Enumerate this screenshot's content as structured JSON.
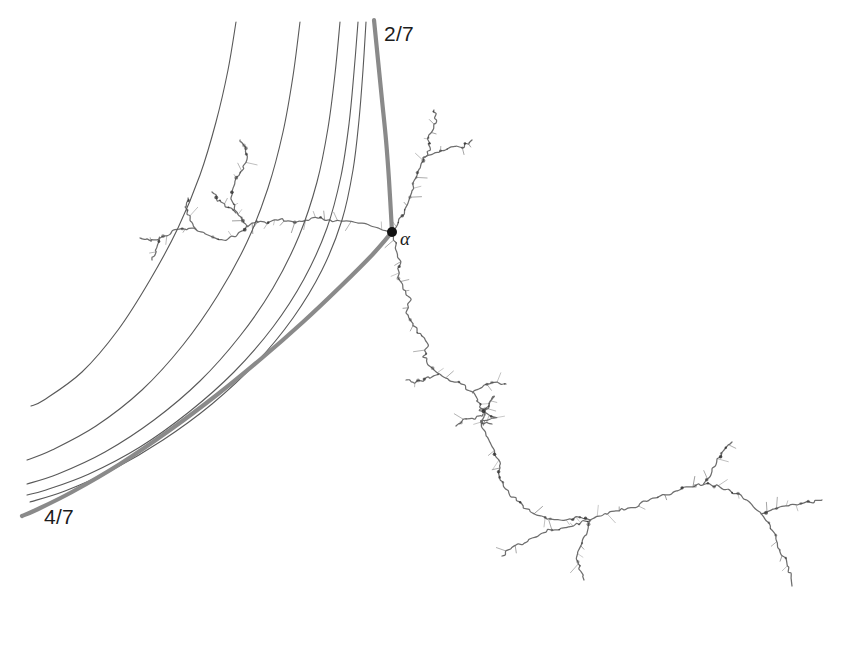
{
  "figure": {
    "background_color": "#ffffff",
    "width": 843,
    "height": 662
  },
  "labels": {
    "ray_upper": "2/7",
    "ray_lower": "4/7",
    "fixed_point": "α"
  },
  "colors": {
    "background": "#ffffff",
    "thin_ray": "#595959",
    "thick_ray": "#8a8a8a",
    "julia_set": "#6e6e6e",
    "julia_set_dark": "#2b2b2b",
    "landing_point": "#111111",
    "label_text": "#1c1c1c"
  },
  "chart_data": {
    "type": "scatter",
    "subtitle": "",
    "xlabel": "",
    "ylabel": "",
    "grid": false,
    "legend": "none",
    "annotations": [
      {
        "text": "2/7",
        "x": 384,
        "y": 32,
        "role": "external-ray-angle-label"
      },
      {
        "text": "4/7",
        "x": 44,
        "y": 515,
        "role": "external-ray-angle-label"
      },
      {
        "text": "α",
        "x": 400,
        "y": 238,
        "role": "fixed-point-label"
      }
    ],
    "landing_point": {
      "x": 392,
      "y": 232,
      "label": "α",
      "radius": 5
    },
    "rays": [
      {
        "name": "ray-thin-1",
        "stroke": "#595959",
        "width": 1.1,
        "points": [
          [
            236,
            22
          ],
          [
            228,
            70
          ],
          [
            216,
            122
          ],
          [
            200,
            175
          ],
          [
            178,
            228
          ],
          [
            150,
            280
          ],
          [
            118,
            330
          ],
          [
            82,
            372
          ],
          [
            44,
            400
          ],
          [
            31,
            406
          ]
        ]
      },
      {
        "name": "ray-thin-2",
        "stroke": "#595959",
        "width": 1.1,
        "points": [
          [
            300,
            22
          ],
          [
            293,
            76
          ],
          [
            283,
            132
          ],
          [
            268,
            188
          ],
          [
            247,
            242
          ],
          [
            218,
            295
          ],
          [
            183,
            345
          ],
          [
            142,
            390
          ],
          [
            96,
            426
          ],
          [
            52,
            450
          ],
          [
            27,
            460
          ]
        ]
      },
      {
        "name": "ray-thin-3",
        "stroke": "#595959",
        "width": 1.1,
        "points": [
          [
            340,
            22
          ],
          [
            335,
            74
          ],
          [
            328,
            128
          ],
          [
            317,
            182
          ],
          [
            299,
            236
          ],
          [
            273,
            288
          ],
          [
            240,
            336
          ],
          [
            200,
            381
          ],
          [
            154,
            420
          ],
          [
            105,
            452
          ],
          [
            58,
            474
          ],
          [
            27,
            484
          ]
        ]
      },
      {
        "name": "ray-thin-4",
        "stroke": "#595959",
        "width": 1.1,
        "points": [
          [
            358,
            22
          ],
          [
            354,
            72
          ],
          [
            349,
            124
          ],
          [
            341,
            176
          ],
          [
            327,
            228
          ],
          [
            304,
            279
          ],
          [
            273,
            327
          ],
          [
            234,
            372
          ],
          [
            189,
            412
          ],
          [
            140,
            447
          ],
          [
            89,
            474
          ],
          [
            46,
            490
          ],
          [
            27,
            495
          ]
        ]
      },
      {
        "name": "ray-thin-5",
        "stroke": "#595959",
        "width": 1.1,
        "points": [
          [
            366,
            22
          ],
          [
            363,
            70
          ],
          [
            359,
            120
          ],
          [
            353,
            170
          ],
          [
            342,
            220
          ],
          [
            322,
            270
          ],
          [
            293,
            318
          ],
          [
            256,
            363
          ],
          [
            212,
            404
          ],
          [
            163,
            440
          ],
          [
            112,
            470
          ],
          [
            65,
            491
          ],
          [
            30,
            502
          ]
        ]
      },
      {
        "name": "ray-thick-2-7",
        "stroke": "#8a8a8a",
        "width": 4.2,
        "label": "2/7",
        "points": [
          [
            374,
            20
          ],
          [
            378,
            60
          ],
          [
            382,
            100
          ],
          [
            386,
            140
          ],
          [
            389,
            180
          ],
          [
            392,
            232
          ]
        ]
      },
      {
        "name": "ray-thick-4-7",
        "stroke": "#8a8a8a",
        "width": 4.2,
        "label": "4/7",
        "points": [
          [
            392,
            232
          ],
          [
            373,
            254
          ],
          [
            340,
            287
          ],
          [
            303,
            322
          ],
          [
            262,
            358
          ],
          [
            218,
            394
          ],
          [
            170,
            430
          ],
          [
            120,
            464
          ],
          [
            72,
            492
          ],
          [
            36,
            510
          ],
          [
            22,
            516
          ]
        ]
      }
    ],
    "julia_set_branches": [
      {
        "name": "main-dendrite-upper-left",
        "points": [
          [
            392,
            232
          ],
          [
            372,
            226
          ],
          [
            352,
            222
          ],
          [
            332,
            221
          ],
          [
            318,
            217
          ],
          [
            306,
            221
          ],
          [
            292,
            222
          ],
          [
            278,
            219
          ],
          [
            266,
            224
          ],
          [
            256,
            220
          ],
          [
            248,
            226
          ],
          [
            242,
            220
          ],
          [
            236,
            212
          ],
          [
            232,
            200
          ],
          [
            233,
            188
          ],
          [
            238,
            176
          ],
          [
            244,
            166
          ],
          [
            248,
            156
          ],
          [
            245,
            147
          ],
          [
            240,
            140
          ]
        ]
      },
      {
        "name": "dendrite-upper-left-branch-a",
        "points": [
          [
            248,
            226
          ],
          [
            236,
            236
          ],
          [
            222,
            240
          ],
          [
            208,
            236
          ],
          [
            196,
            230
          ],
          [
            184,
            228
          ],
          [
            172,
            232
          ],
          [
            160,
            238
          ],
          [
            150,
            240
          ],
          [
            140,
            238
          ]
        ]
      },
      {
        "name": "dendrite-upper-left-branch-b",
        "points": [
          [
            196,
            230
          ],
          [
            190,
            220
          ],
          [
            186,
            208
          ],
          [
            188,
            198
          ]
        ]
      },
      {
        "name": "dendrite-upper-left-branch-c",
        "points": [
          [
            160,
            238
          ],
          [
            156,
            250
          ],
          [
            152,
            260
          ]
        ]
      },
      {
        "name": "dendrite-upper-left-tip",
        "points": [
          [
            236,
            212
          ],
          [
            226,
            206
          ],
          [
            218,
            200
          ],
          [
            212,
            192
          ]
        ]
      },
      {
        "name": "main-dendrite-upper-right",
        "points": [
          [
            392,
            232
          ],
          [
            400,
            220
          ],
          [
            406,
            206
          ],
          [
            412,
            194
          ],
          [
            414,
            180
          ],
          [
            420,
            170
          ],
          [
            424,
            158
          ],
          [
            430,
            150
          ],
          [
            428,
            140
          ],
          [
            432,
            130
          ],
          [
            436,
            120
          ],
          [
            434,
            110
          ]
        ]
      },
      {
        "name": "dendrite-upper-right-branch",
        "points": [
          [
            424,
            158
          ],
          [
            438,
            152
          ],
          [
            452,
            148
          ],
          [
            464,
            146
          ],
          [
            472,
            140
          ]
        ]
      },
      {
        "name": "main-dendrite-lower",
        "points": [
          [
            392,
            232
          ],
          [
            396,
            248
          ],
          [
            400,
            262
          ],
          [
            398,
            276
          ],
          [
            404,
            288
          ],
          [
            410,
            300
          ],
          [
            406,
            312
          ],
          [
            412,
            324
          ],
          [
            420,
            334
          ],
          [
            428,
            344
          ],
          [
            424,
            356
          ],
          [
            430,
            366
          ],
          [
            440,
            374
          ],
          [
            450,
            380
          ],
          [
            462,
            384
          ],
          [
            472,
            392
          ],
          [
            478,
            402
          ],
          [
            484,
            414
          ],
          [
            482,
            426
          ],
          [
            488,
            438
          ],
          [
            494,
            450
          ],
          [
            500,
            462
          ],
          [
            498,
            474
          ],
          [
            504,
            486
          ],
          [
            512,
            496
          ],
          [
            522,
            506
          ],
          [
            534,
            514
          ],
          [
            548,
            518
          ],
          [
            562,
            520
          ],
          [
            576,
            518
          ],
          [
            590,
            520
          ]
        ]
      },
      {
        "name": "dendrite-lower-branch-left",
        "points": [
          [
            440,
            374
          ],
          [
            428,
            378
          ],
          [
            416,
            382
          ],
          [
            406,
            380
          ]
        ]
      },
      {
        "name": "dendrite-lower-branch-mid",
        "points": [
          [
            484,
            414
          ],
          [
            474,
            418
          ],
          [
            464,
            420
          ],
          [
            456,
            426
          ]
        ]
      },
      {
        "name": "dendrite-lower-branch-right-up",
        "points": [
          [
            472,
            392
          ],
          [
            484,
            386
          ],
          [
            496,
            382
          ],
          [
            506,
            384
          ]
        ]
      },
      {
        "name": "dendrite-trifurcation-down",
        "points": [
          [
            590,
            520
          ],
          [
            586,
            534
          ],
          [
            580,
            546
          ],
          [
            576,
            558
          ],
          [
            580,
            570
          ],
          [
            584,
            580
          ]
        ]
      },
      {
        "name": "dendrite-trifurcation-left",
        "points": [
          [
            590,
            520
          ],
          [
            576,
            524
          ],
          [
            562,
            528
          ],
          [
            548,
            530
          ],
          [
            536,
            536
          ],
          [
            524,
            542
          ],
          [
            512,
            548
          ],
          [
            502,
            556
          ]
        ]
      },
      {
        "name": "dendrite-trifurcation-right",
        "points": [
          [
            590,
            520
          ],
          [
            604,
            514
          ],
          [
            618,
            510
          ],
          [
            632,
            508
          ],
          [
            644,
            502
          ],
          [
            656,
            498
          ],
          [
            668,
            494
          ],
          [
            680,
            490
          ],
          [
            692,
            486
          ],
          [
            704,
            484
          ],
          [
            716,
            486
          ],
          [
            728,
            490
          ],
          [
            740,
            496
          ],
          [
            752,
            504
          ],
          [
            762,
            514
          ],
          [
            770,
            526
          ],
          [
            776,
            538
          ],
          [
            780,
            550
          ]
        ]
      },
      {
        "name": "dendrite-right-branch-up",
        "points": [
          [
            704,
            484
          ],
          [
            712,
            472
          ],
          [
            718,
            460
          ],
          [
            724,
            450
          ],
          [
            732,
            442
          ]
        ]
      },
      {
        "name": "dendrite-far-right-branch",
        "points": [
          [
            762,
            514
          ],
          [
            774,
            510
          ],
          [
            786,
            506
          ],
          [
            798,
            504
          ],
          [
            810,
            502
          ],
          [
            822,
            500
          ]
        ]
      },
      {
        "name": "dendrite-right-tail",
        "points": [
          [
            780,
            550
          ],
          [
            786,
            562
          ],
          [
            790,
            574
          ],
          [
            792,
            586
          ]
        ]
      },
      {
        "name": "star-cluster-node",
        "points": [
          [
            484,
            414
          ],
          [
            490,
            404
          ],
          [
            494,
            396
          ],
          [
            488,
            408
          ],
          [
            478,
            410
          ],
          [
            496,
            418
          ],
          [
            480,
            422
          ],
          [
            492,
            424
          ]
        ]
      }
    ]
  }
}
